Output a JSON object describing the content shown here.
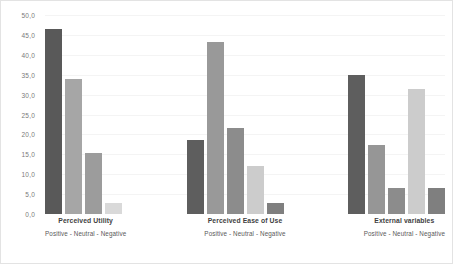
{
  "chart_data": {
    "type": "bar",
    "title": "",
    "xlabel": "",
    "ylabel": "",
    "ylim": [
      0,
      50
    ],
    "grid": true,
    "legend_position": "below-each-group",
    "y_ticks": [
      "0,0",
      "5,0",
      "10,0",
      "15,0",
      "20,0",
      "25,0",
      "30,0",
      "35,0",
      "40,0",
      "45,0",
      "50,0"
    ],
    "y_tick_values": [
      0,
      5,
      10,
      15,
      20,
      25,
      30,
      35,
      40,
      45,
      50
    ],
    "categories": [
      "Perceived Utility",
      "Perceived Ease of Use",
      "External variables"
    ],
    "legend_text": "Positive - Neutral  -  Negative",
    "legend_entries": [
      "Positive",
      "Neutral",
      "Negative"
    ],
    "groups": [
      {
        "name": "Perceived Utility",
        "legend": "Positive - Neutral  -  Negative",
        "bars": [
          {
            "value": 46.5,
            "color": "#595959"
          },
          {
            "value": 34.0,
            "color": "#a6a6a6"
          },
          {
            "value": 15.3,
            "color": "#9c9c9c"
          },
          {
            "value": 2.8,
            "color": "#d9d9d9"
          }
        ]
      },
      {
        "name": "Perceived Ease of Use",
        "legend": "Positive - Neutral  -  Negative",
        "bars": [
          {
            "value": 18.5,
            "color": "#5e5e5e"
          },
          {
            "value": 43.3,
            "color": "#999999"
          },
          {
            "value": 21.5,
            "color": "#8c8c8c"
          },
          {
            "value": 12.0,
            "color": "#cccccc"
          },
          {
            "value": 2.7,
            "color": "#7f7f7f"
          }
        ]
      },
      {
        "name": "External variables",
        "legend": "Positive - Neutral  -  Negative",
        "bars": [
          {
            "value": 35.0,
            "color": "#5e5e5e"
          },
          {
            "value": 17.3,
            "color": "#969696"
          },
          {
            "value": 6.6,
            "color": "#8c8c8c"
          },
          {
            "value": 31.5,
            "color": "#cccccc"
          },
          {
            "value": 6.6,
            "color": "#7f7f7f"
          }
        ]
      }
    ]
  }
}
